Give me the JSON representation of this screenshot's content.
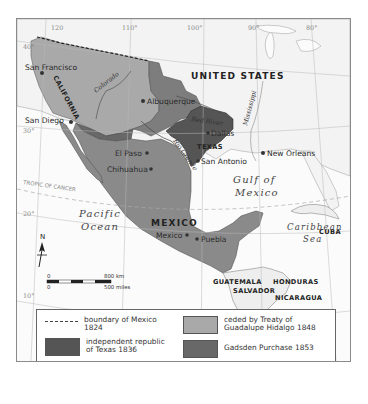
{
  "map": {
    "countries": {
      "united_states": "UNITED STATES",
      "mexico": "MEXICO",
      "cuba": "CUBA",
      "guatemala": "GUATEMALA",
      "honduras": "HONDURAS",
      "salvador": "SALVADOR",
      "nicaragua": "NICARAGUA"
    },
    "regions": {
      "california": "CALIFORNIA",
      "texas": "TEXAS"
    },
    "cities": {
      "san_francisco": "San Francisco",
      "san_diego": "San Diego",
      "albuquerque": "Albuquerque",
      "dallas": "Dallas",
      "el_paso": "El Paso",
      "san_antonio": "San Antonio",
      "chihuahua": "Chihuahua",
      "new_orleans": "New Orleans",
      "mexico_city": "Mexico",
      "puebla": "Puebla"
    },
    "rivers": {
      "colorado": "Colorado",
      "red_river": "Red River",
      "mississippi": "Mississippi",
      "rio_grande": "Rio Grande"
    },
    "water": {
      "pacific_1": "Pacific",
      "pacific_2": "Ocean",
      "gulf_1": "Gulf of",
      "gulf_2": "Mexico",
      "caribbean_1": "Caribbean",
      "caribbean_2": "Sea"
    },
    "graticule": {
      "lon_120": "120",
      "lon_110": "110°",
      "lon_100": "100°",
      "lon_90": "90°",
      "lon_80": "80°",
      "lat_40": "40°",
      "lat_30": "30°",
      "lat_20": "20°",
      "lat_10": "10°",
      "tropic": "TROPIC OF CANCER"
    },
    "compass": {
      "label": "N"
    },
    "scale": {
      "km_zero": "0",
      "km_max": "800 km",
      "mi_zero": "0",
      "mi_max": "500 miles"
    },
    "colors": {
      "land": "#f4f4f4",
      "ceded_1848": "#a9a9a9",
      "texas_1836": "#555555",
      "ceded_texas_1845": "#7d7d7d",
      "gadsden_1853": "#686868",
      "mexico_after_1853": "#8a8a8a"
    }
  },
  "legend": {
    "items": [
      {
        "label_1": "boundary of Mexico",
        "label_2": "1824"
      },
      {
        "label_1": "independent republic",
        "label_2": "of Texas 1836"
      },
      {
        "label_1": "ceded to Texas 1845",
        "label_2": ""
      },
      {
        "label_1": "ceded by Treaty of",
        "label_2": "Guadalupe Hidalgo 1848"
      },
      {
        "label_1": "Gadsden Purchase 1853",
        "label_2": ""
      },
      {
        "label_1": "Mexico after 1853",
        "label_2": ""
      }
    ]
  }
}
